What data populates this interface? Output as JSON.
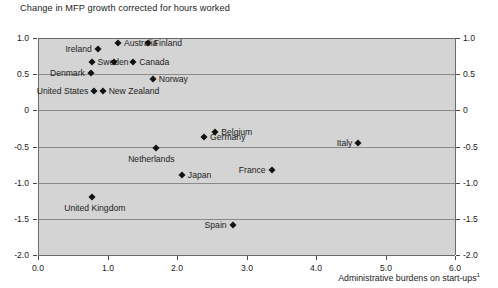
{
  "chart": {
    "title": "Change in MFP growth corrected for hours worked",
    "xaxis_caption": "Administrative burdens on start-ups",
    "footnote_marker": "1"
  },
  "chart_data": {
    "type": "scatter",
    "title": "Change in MFP growth corrected for hours worked",
    "xlabel": "Administrative burdens on start-ups 1",
    "ylabel": "Change in MFP growth corrected for hours worked",
    "xlim": [
      0.0,
      6.0
    ],
    "ylim": [
      -2.0,
      1.0
    ],
    "xticks": [
      "0.0",
      "1.0",
      "2.0",
      "3.0",
      "4.0",
      "5.0",
      "6.0"
    ],
    "xtick_values": [
      0.0,
      1.0,
      2.0,
      3.0,
      4.0,
      5.0,
      6.0
    ],
    "yticks": [
      "1.0",
      "0.5",
      "0",
      "-0.5",
      "-1.0",
      "-1.5",
      "-2.0"
    ],
    "ytick_values": [
      1.0,
      0.5,
      0.0,
      -0.5,
      -1.0,
      -1.5,
      -2.0
    ],
    "grid": true,
    "grid_axis": "y",
    "legend": "none",
    "dual_y_axis": true,
    "marker_shape": "diamond",
    "marker_color": "#111111",
    "plot_background": "#d4d4d4",
    "points": [
      {
        "name": "Australia",
        "x": 1.15,
        "y": 0.93,
        "label_side": "right"
      },
      {
        "name": "Finland",
        "x": 1.58,
        "y": 0.93,
        "label_side": "right"
      },
      {
        "name": "Ireland",
        "x": 0.86,
        "y": 0.85,
        "label_side": "left"
      },
      {
        "name": "Sweden",
        "x": 0.77,
        "y": 0.67,
        "label_side": "right"
      },
      {
        "name": "",
        "x": 1.1,
        "y": 0.67,
        "label_side": "right"
      },
      {
        "name": "Canada",
        "x": 1.37,
        "y": 0.67,
        "label_side": "right"
      },
      {
        "name": "Denmark",
        "x": 0.76,
        "y": 0.52,
        "label_side": "left"
      },
      {
        "name": "Norway",
        "x": 1.65,
        "y": 0.44,
        "label_side": "right"
      },
      {
        "name": "United States",
        "x": 0.81,
        "y": 0.27,
        "label_side": "left"
      },
      {
        "name": "New Zealand",
        "x": 0.93,
        "y": 0.27,
        "label_side": "right"
      },
      {
        "name": "Belgium",
        "x": 2.55,
        "y": -0.3,
        "label_side": "right"
      },
      {
        "name": "Germany",
        "x": 2.39,
        "y": -0.37,
        "label_side": "right"
      },
      {
        "name": "Italy",
        "x": 4.61,
        "y": -0.45,
        "label_side": "left"
      },
      {
        "name": "Netherlands",
        "x": 1.7,
        "y": -0.52,
        "label_side": "below"
      },
      {
        "name": "France",
        "x": 3.36,
        "y": -0.83,
        "label_side": "left"
      },
      {
        "name": "Japan",
        "x": 2.07,
        "y": -0.9,
        "label_side": "right"
      },
      {
        "name": "United Kingdom",
        "x": 0.78,
        "y": -1.2,
        "label_side": "below"
      },
      {
        "name": "Spain",
        "x": 2.8,
        "y": -1.58,
        "label_side": "left"
      }
    ]
  }
}
